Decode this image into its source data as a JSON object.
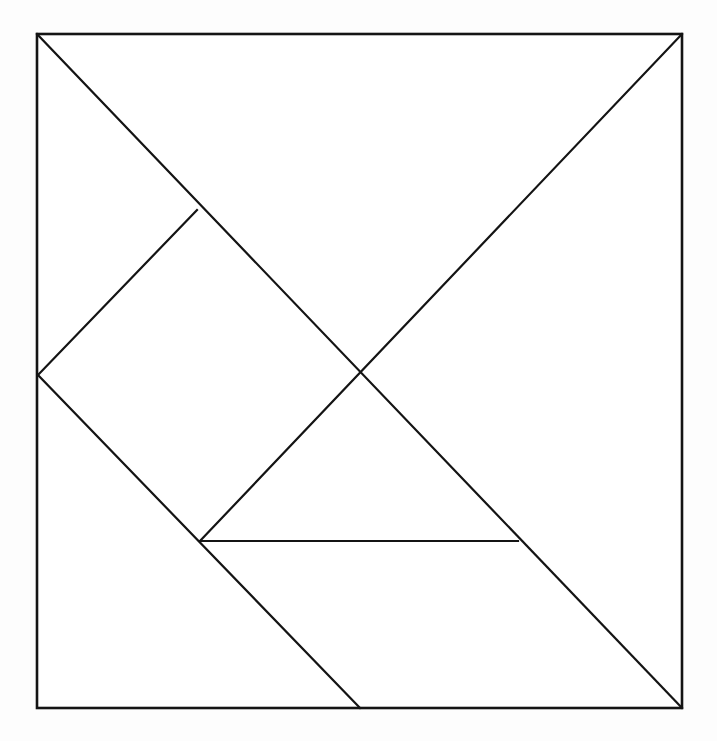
{
  "figure": {
    "name": "tangram-dissection",
    "background_color": "#fdfdfd",
    "line_color": "#141414",
    "fill_color": "#ffffff",
    "line_width": 2.2,
    "outline_width": 2.6,
    "canvas": {
      "width": 717,
      "height": 741
    }
  },
  "square": {
    "name": "outer-square",
    "top_left": [
      37,
      34
    ],
    "top_right": [
      682,
      34
    ],
    "bottom_right": [
      682,
      708
    ],
    "bottom_left": [
      37,
      708
    ],
    "width": 645,
    "height": 674
  },
  "vertices": {
    "top_left_corner": [
      37,
      34
    ],
    "top_right_corner": [
      682,
      34
    ],
    "bottom_right_corner": [
      682,
      708
    ],
    "bottom_left_corner": [
      37,
      708
    ],
    "left_edge_midpoint": [
      38,
      375
    ],
    "bottom_edge_midpoint": [
      360,
      708
    ],
    "center": [
      361,
      374
    ],
    "upper_left_quarter": [
      197,
      210
    ],
    "lower_left_quarter": [
      200,
      541
    ],
    "parallelogram_right": [
      518,
      541
    ]
  },
  "cut_lines": [
    {
      "name": "main-diagonal-tl-br",
      "from": [
        37,
        34
      ],
      "to": [
        682,
        708
      ],
      "note": "Full diagonal from top-left corner to bottom-right corner"
    },
    {
      "name": "anti-diagonal-tr-to-lower-quarter",
      "from": [
        682,
        34
      ],
      "to": [
        200,
        541
      ],
      "note": "From top-right corner through center down to lower-left quarter point"
    },
    {
      "name": "small-triangle-cut-upper",
      "from": [
        38,
        375
      ],
      "to": [
        197,
        210
      ],
      "note": "Left edge midpoint up to the upper-left quarter point"
    },
    {
      "name": "square-piece-cut-lower",
      "from": [
        38,
        375
      ],
      "to": [
        360,
        708
      ],
      "note": "Left edge midpoint down through lower-left quarter to bottom edge midpoint"
    },
    {
      "name": "parallelogram-horizontal-cut",
      "from": [
        200,
        541
      ],
      "to": [
        518,
        541
      ],
      "note": "Horizontal cut forming the top edge of the parallelogram"
    }
  ],
  "pieces": [
    {
      "name": "large-triangle-upper-right",
      "type": "large-triangle",
      "points": [
        [
          37,
          34
        ],
        [
          682,
          34
        ],
        [
          361,
          374
        ]
      ]
    },
    {
      "name": "large-triangle-lower-left",
      "type": "large-triangle",
      "points": [
        [
          37,
          34
        ],
        [
          361,
          374
        ],
        [
          38,
          375
        ]
      ]
    },
    {
      "name": "small-triangle-top",
      "type": "small-triangle",
      "points": [
        [
          37,
          34
        ],
        [
          197,
          210
        ],
        [
          38,
          375
        ]
      ]
    },
    {
      "name": "square-piece",
      "type": "square",
      "points": [
        [
          197,
          210
        ],
        [
          361,
          374
        ],
        [
          200,
          541
        ],
        [
          38,
          375
        ]
      ]
    },
    {
      "name": "medium-triangle",
      "type": "medium-triangle",
      "points": [
        [
          361,
          374
        ],
        [
          518,
          541
        ],
        [
          200,
          541
        ]
      ]
    },
    {
      "name": "parallelogram-piece",
      "type": "parallelogram",
      "points": [
        [
          200,
          541
        ],
        [
          518,
          541
        ],
        [
          682,
          708
        ],
        [
          360,
          708
        ]
      ]
    },
    {
      "name": "small-triangle-bottom",
      "type": "small-triangle",
      "points": [
        [
          38,
          375
        ],
        [
          200,
          541
        ],
        [
          360,
          708
        ]
      ]
    }
  ]
}
